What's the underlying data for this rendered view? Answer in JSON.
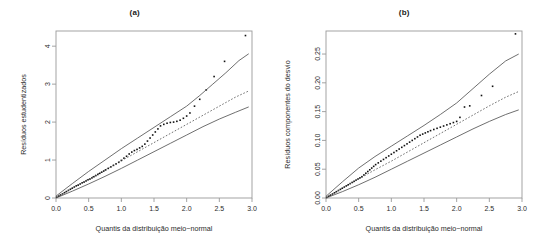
{
  "figure": {
    "panels": [
      {
        "title": "(a)",
        "xlabel": "Quantis da distribuição meio−normal",
        "ylabel": "Resíduos estudentizados",
        "xticks": [
          "0.0",
          "0.5",
          "1.0",
          "1.5",
          "2.0",
          "2.5",
          "3.0"
        ],
        "yticks": [
          "0",
          "1",
          "2",
          "3",
          "4"
        ]
      },
      {
        "title": "(b)",
        "xlabel": "Quantis da distribuição meio−normal",
        "ylabel": "Resíduos componentes do desvio",
        "xticks": [
          "0.0",
          "0.5",
          "1.0",
          "1.5",
          "2.0",
          "2.5",
          "3.0"
        ],
        "yticks": [
          "0.00",
          "0.05",
          "0.10",
          "0.15",
          "0.20",
          "0.25"
        ]
      }
    ]
  },
  "colors": {
    "frame": "#9a9a9a",
    "points": "#111111",
    "envelope": "#555555",
    "median": "#555555",
    "text": "#2b2b2b"
  },
  "chart_data": [
    {
      "type": "scatter",
      "title": "(a)",
      "xlabel": "Quantis da distribuição meio−normal",
      "ylabel": "Resíduos estudentizados",
      "xlim": [
        0.0,
        3.0
      ],
      "ylim": [
        0.0,
        4.4
      ],
      "xticks": [
        0.0,
        0.5,
        1.0,
        1.5,
        2.0,
        2.5,
        3.0
      ],
      "yticks": [
        0,
        1,
        2,
        3,
        4
      ],
      "grid": false,
      "legend": null,
      "annotations": [
        "half-normal plot with simulated envelope"
      ],
      "series": [
        {
          "name": "Resíduos observados",
          "kind": "points",
          "x": [
            0.01,
            0.04,
            0.07,
            0.1,
            0.13,
            0.16,
            0.19,
            0.22,
            0.25,
            0.28,
            0.31,
            0.34,
            0.37,
            0.4,
            0.43,
            0.46,
            0.49,
            0.52,
            0.55,
            0.58,
            0.61,
            0.64,
            0.67,
            0.7,
            0.73,
            0.76,
            0.8,
            0.84,
            0.88,
            0.92,
            0.96,
            1.0,
            1.04,
            1.08,
            1.12,
            1.16,
            1.2,
            1.24,
            1.28,
            1.32,
            1.36,
            1.4,
            1.44,
            1.48,
            1.52,
            1.56,
            1.6,
            1.65,
            1.7,
            1.75,
            1.8,
            1.85,
            1.9,
            1.95,
            2.0,
            2.05,
            2.12,
            2.2,
            2.3,
            2.42,
            2.58,
            2.9
          ],
          "y": [
            0.02,
            0.05,
            0.08,
            0.11,
            0.14,
            0.17,
            0.2,
            0.23,
            0.26,
            0.29,
            0.32,
            0.34,
            0.37,
            0.4,
            0.42,
            0.45,
            0.48,
            0.5,
            0.53,
            0.56,
            0.59,
            0.62,
            0.65,
            0.68,
            0.71,
            0.74,
            0.78,
            0.82,
            0.86,
            0.9,
            0.94,
            0.99,
            1.05,
            1.1,
            1.16,
            1.21,
            1.25,
            1.28,
            1.32,
            1.36,
            1.42,
            1.5,
            1.58,
            1.66,
            1.74,
            1.82,
            1.9,
            1.94,
            1.97,
            1.99,
            2.0,
            2.02,
            2.05,
            2.1,
            2.16,
            2.24,
            2.42,
            2.6,
            2.85,
            3.2,
            3.6,
            4.28
          ]
        },
        {
          "name": "Envelope superior",
          "kind": "line",
          "x": [
            0.0,
            0.25,
            0.5,
            0.75,
            1.0,
            1.25,
            1.5,
            1.75,
            2.0,
            2.2,
            2.4,
            2.6,
            2.8,
            2.95
          ],
          "y": [
            0.05,
            0.38,
            0.7,
            1.0,
            1.3,
            1.58,
            1.86,
            2.14,
            2.42,
            2.7,
            3.0,
            3.3,
            3.62,
            3.8
          ]
        },
        {
          "name": "Mediana simulada",
          "kind": "dotted-line",
          "x": [
            0.0,
            0.25,
            0.5,
            0.75,
            1.0,
            1.25,
            1.5,
            1.75,
            2.0,
            2.25,
            2.5,
            2.75,
            2.95
          ],
          "y": [
            0.02,
            0.26,
            0.5,
            0.74,
            0.98,
            1.22,
            1.46,
            1.7,
            1.94,
            2.18,
            2.42,
            2.66,
            2.82
          ]
        },
        {
          "name": "Envelope inferior",
          "kind": "line",
          "x": [
            0.0,
            0.25,
            0.5,
            0.75,
            1.0,
            1.25,
            1.5,
            1.75,
            2.0,
            2.25,
            2.5,
            2.75,
            2.95
          ],
          "y": [
            0.0,
            0.18,
            0.37,
            0.57,
            0.78,
            1.0,
            1.22,
            1.44,
            1.66,
            1.88,
            2.08,
            2.26,
            2.4
          ]
        }
      ]
    },
    {
      "type": "scatter",
      "title": "(b)",
      "xlabel": "Quantis da distribuição meio−normal",
      "ylabel": "Resíduos componentes do desvio",
      "xlim": [
        0.0,
        3.0
      ],
      "ylim": [
        0.0,
        0.29
      ],
      "xticks": [
        0.0,
        0.5,
        1.0,
        1.5,
        2.0,
        2.5,
        3.0
      ],
      "yticks": [
        0.0,
        0.05,
        0.1,
        0.15,
        0.2,
        0.25
      ],
      "grid": false,
      "legend": null,
      "annotations": [
        "half-normal plot with simulated envelope"
      ],
      "series": [
        {
          "name": "Resíduos observados",
          "kind": "points",
          "x": [
            0.01,
            0.04,
            0.07,
            0.1,
            0.13,
            0.16,
            0.19,
            0.22,
            0.25,
            0.28,
            0.31,
            0.34,
            0.37,
            0.4,
            0.43,
            0.46,
            0.49,
            0.52,
            0.55,
            0.58,
            0.61,
            0.64,
            0.67,
            0.7,
            0.73,
            0.76,
            0.8,
            0.84,
            0.88,
            0.92,
            0.96,
            1.0,
            1.04,
            1.08,
            1.12,
            1.16,
            1.2,
            1.24,
            1.28,
            1.32,
            1.36,
            1.4,
            1.44,
            1.48,
            1.52,
            1.56,
            1.6,
            1.65,
            1.7,
            1.75,
            1.8,
            1.85,
            1.9,
            1.95,
            2.0,
            2.05,
            2.12,
            2.2,
            2.38,
            2.55,
            2.9
          ],
          "y": [
            0.001,
            0.003,
            0.005,
            0.007,
            0.009,
            0.011,
            0.013,
            0.015,
            0.017,
            0.019,
            0.021,
            0.023,
            0.025,
            0.027,
            0.029,
            0.031,
            0.033,
            0.035,
            0.037,
            0.04,
            0.043,
            0.046,
            0.049,
            0.052,
            0.055,
            0.058,
            0.061,
            0.064,
            0.067,
            0.07,
            0.073,
            0.076,
            0.079,
            0.082,
            0.085,
            0.088,
            0.091,
            0.094,
            0.097,
            0.1,
            0.103,
            0.106,
            0.109,
            0.111,
            0.113,
            0.115,
            0.117,
            0.119,
            0.121,
            0.123,
            0.125,
            0.127,
            0.129,
            0.131,
            0.133,
            0.14,
            0.158,
            0.16,
            0.178,
            0.194,
            0.285
          ]
        },
        {
          "name": "Envelope superior",
          "kind": "line",
          "x": [
            0.0,
            0.25,
            0.5,
            0.75,
            1.0,
            1.25,
            1.5,
            1.75,
            2.0,
            2.25,
            2.5,
            2.75,
            2.95
          ],
          "y": [
            0.003,
            0.028,
            0.052,
            0.072,
            0.09,
            0.108,
            0.126,
            0.145,
            0.165,
            0.19,
            0.215,
            0.238,
            0.25
          ]
        },
        {
          "name": "Mediana simulada",
          "kind": "dotted-line",
          "x": [
            0.0,
            0.25,
            0.5,
            0.75,
            1.0,
            1.25,
            1.5,
            1.75,
            2.0,
            2.25,
            2.5,
            2.75,
            2.95
          ],
          "y": [
            0.001,
            0.017,
            0.033,
            0.049,
            0.064,
            0.08,
            0.096,
            0.112,
            0.128,
            0.144,
            0.16,
            0.175,
            0.185
          ]
        },
        {
          "name": "Envelope inferior",
          "kind": "line",
          "x": [
            0.0,
            0.25,
            0.5,
            0.75,
            1.0,
            1.25,
            1.5,
            1.75,
            2.0,
            2.25,
            2.5,
            2.75,
            2.95
          ],
          "y": [
            0.0,
            0.011,
            0.023,
            0.036,
            0.05,
            0.064,
            0.078,
            0.092,
            0.106,
            0.12,
            0.133,
            0.145,
            0.153
          ]
        }
      ]
    }
  ]
}
